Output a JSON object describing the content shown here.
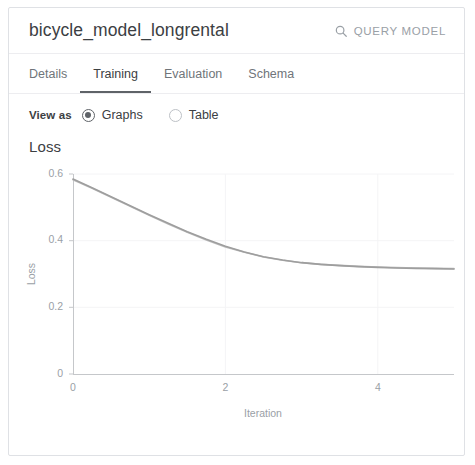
{
  "header": {
    "title": "bicycle_model_longrental",
    "query_button_label": "QUERY MODEL",
    "query_button_icon": "search-icon"
  },
  "tabs": [
    {
      "label": "Details",
      "active": false
    },
    {
      "label": "Training",
      "active": true
    },
    {
      "label": "Evaluation",
      "active": false
    },
    {
      "label": "Schema",
      "active": false
    }
  ],
  "view_as": {
    "label": "View as",
    "options": [
      {
        "label": "Graphs",
        "selected": true
      },
      {
        "label": "Table",
        "selected": false
      }
    ]
  },
  "chart_heading": "Loss",
  "colors": {
    "text_primary": "#3c4043",
    "text_secondary": "#70757a",
    "tick": "#9aa0a6",
    "border": "#dfe1e5",
    "tab_indicator": "#5f6368",
    "series_training": "#9e9e9e",
    "series_eval": "#bdbdbd"
  },
  "chart_data": {
    "type": "line",
    "title": "Loss",
    "xlabel": "Iteration",
    "ylabel": "Loss",
    "xlim": [
      0,
      5
    ],
    "ylim": [
      0,
      0.6
    ],
    "xticks": [
      0,
      2,
      4
    ],
    "yticks": [
      0,
      0.2,
      0.4,
      0.6
    ],
    "xtick_labels": [
      "0",
      "2",
      "4"
    ],
    "ytick_labels": [
      "0",
      "0.2",
      "0.4",
      "0.6"
    ],
    "grid": true,
    "legend": "none",
    "x": [
      0,
      0.25,
      0.5,
      0.75,
      1,
      1.25,
      1.5,
      1.75,
      2,
      2.25,
      2.5,
      2.75,
      3,
      3.25,
      3.5,
      3.75,
      4,
      4.25,
      4.5,
      4.75,
      5
    ],
    "series": [
      {
        "name": "Training loss",
        "color": "#9e9e9e",
        "values": [
          0.585,
          0.559,
          0.532,
          0.505,
          0.478,
          0.452,
          0.427,
          0.404,
          0.383,
          0.366,
          0.352,
          0.342,
          0.334,
          0.329,
          0.325,
          0.322,
          0.32,
          0.318,
          0.317,
          0.316,
          0.315
        ]
      },
      {
        "name": "Evaluation loss",
        "color": "#bdbdbd",
        "values": [
          0.583,
          0.557,
          0.53,
          0.503,
          0.476,
          0.45,
          0.425,
          0.402,
          0.381,
          0.365,
          0.351,
          0.341,
          0.334,
          0.329,
          0.326,
          0.323,
          0.321,
          0.319,
          0.318,
          0.317,
          0.316
        ]
      }
    ]
  }
}
